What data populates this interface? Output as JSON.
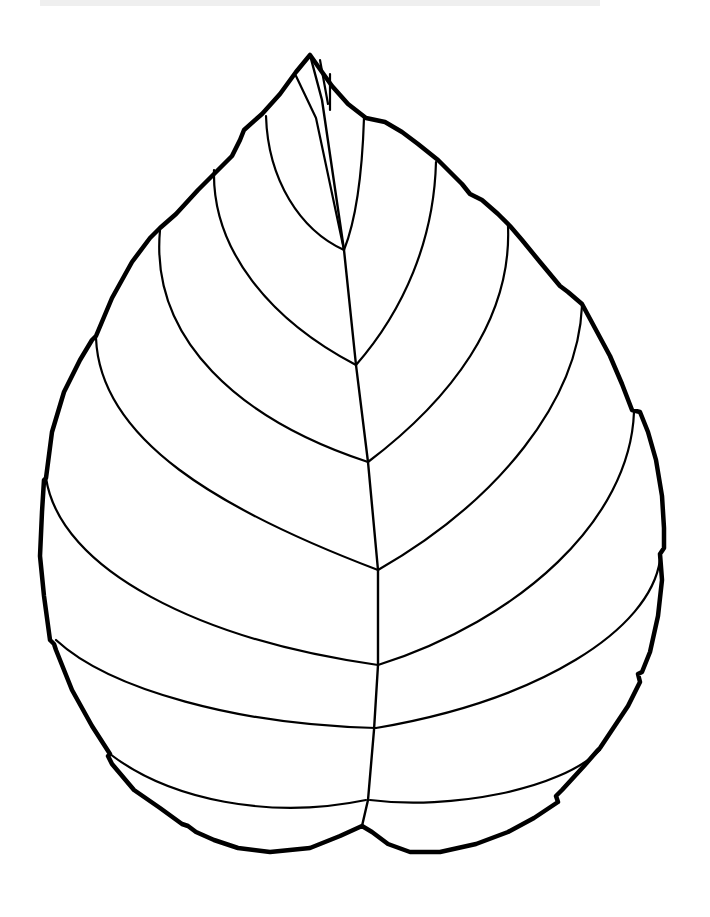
{
  "image": {
    "subject": "Leaf outline coloring page",
    "background": "#ffffff",
    "ink": "#000000"
  },
  "leaf": {
    "outline": "M310,55 L322,72 L332,86 L348,104 L366,118 L385,122 L402,132 L418,144 L438,160 L462,184 L470,194 L482,200 L498,214 L510,226 L522,240 L540,262 L560,286 L568,292 L582,304 L596,330 L610,356 L622,384 L632,410 L640,412 L648,432 L656,460 L662,496 L664,528 L664,548 L660,554 L662,580 L658,616 L650,652 L642,672 L638,674 L640,682 L628,706 L612,730 L600,748 L598,750 L584,766 L562,790 L556,796 L558,802 L534,818 L508,832 L476,844 L440,852 L410,852 L388,844 L372,832 L362,826 L340,836 L310,848 L270,852 L238,848 L214,840 L196,832 L188,826 L182,824 L160,808 L134,790 L112,764 L108,756 L110,754 L92,726 L72,690 L56,650 L54,644 L50,640 L44,596 L40,556 L42,512 L44,480 L46,478 L52,432 L64,392 L80,360 L92,340 L96,336 L112,298 L132,262 L150,238 L158,230 L160,228 L176,214 L198,190 L214,174 L232,156 L240,140 L244,130 L262,114 L280,94 L296,72 Z",
    "midrib": "M310,55 L322,100 L344,250 L356,365 L368,462 L378,570 L378,665 L374,730 L368,800 L362,826",
    "veins": [
      "M296,76 L316,118 L344,250",
      "M320,60 L328,104",
      "M330,74 L330,110",
      "M266,116 C268,180 300,230 344,250",
      "M364,118 C362,180 356,220 344,250",
      "M214,170 C212,250 270,320 356,365",
      "M436,162 C434,240 404,310 356,365",
      "M160,230 C150,340 240,420 368,462",
      "M508,226 C512,320 450,400 368,462",
      "M96,338 C100,440 220,510 378,570",
      "M582,306 C578,400 500,500 378,570",
      "M46,478 C60,570 200,640 378,665",
      "M634,412 C630,520 520,620 378,665",
      "M56,640 C110,690 240,725 376,728",
      "M660,560 C650,630 540,700 376,728",
      "M110,754 C170,800 270,820 366,800",
      "M600,750 C560,790 450,810 370,800"
    ]
  }
}
